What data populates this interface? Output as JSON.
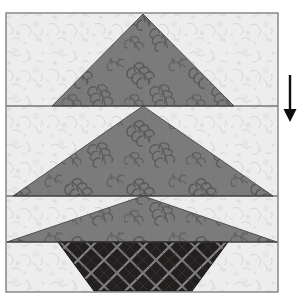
{
  "figure": {
    "name": "pieced-tree-quilt-block",
    "canvas": {
      "width": 298,
      "height": 302,
      "background": "#ffffff"
    }
  },
  "block": {
    "x": 6,
    "y": 13,
    "width": 272,
    "height": 279,
    "outline_color": "#808080",
    "outline_width": 1.4
  },
  "fabrics": {
    "background": {
      "label": "background-fabric",
      "color": "#ededed",
      "speckle_color": "#d2d2d2",
      "speckle_color_2": "#c4c4c4"
    },
    "tree": {
      "label": "tree-fabric",
      "color": "#7b7b7b",
      "motif_color": "#5e5e5e",
      "motif_color_2": "#6a6a6a",
      "motif": "leaf-sprig"
    },
    "trunk": {
      "label": "trunk-fabric",
      "color": "#231f1f",
      "lattice_color": "#8a8a8a",
      "lattice_color_2": "#6f6f6f",
      "motif": "lattice-grid"
    }
  },
  "seams": {
    "color": "#3a3a3a",
    "width": 1.2,
    "rows": [
      {
        "name": "seam-row-1",
        "y": 106
      },
      {
        "name": "seam-row-2",
        "y": 196
      },
      {
        "name": "seam-row-3",
        "y": 242
      }
    ]
  },
  "units": [
    {
      "name": "tree-tier-top",
      "type": "triangle",
      "points": "143,14 52,106 234,106",
      "fabric": "tree"
    },
    {
      "name": "tree-tier-middle",
      "type": "triangle",
      "points": "143,106 13,196 273,196",
      "fabric": "tree"
    },
    {
      "name": "tree-tier-bottom",
      "type": "triangle",
      "points": "143,196 7,242 277,242",
      "fabric": "tree"
    },
    {
      "name": "tree-trunk",
      "type": "trapezoid",
      "points": "58,242 228,242 192,291 94,291",
      "fabric": "trunk"
    }
  ],
  "arrow": {
    "name": "pressing-direction-arrow",
    "direction": "down",
    "color": "#0d0d0d",
    "x": 290,
    "y_start": 75,
    "y_end": 122,
    "shaft_width": 2.4,
    "head_width": 13,
    "head_height": 13
  }
}
